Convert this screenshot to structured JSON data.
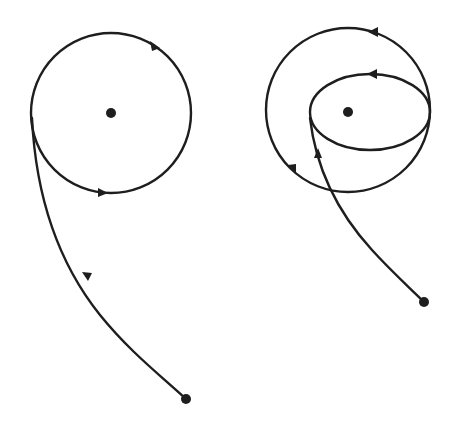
{
  "diagram": {
    "colors": {
      "line": "#1e1e1e",
      "background": "#ffffff"
    },
    "left_figure": {
      "central_body": {
        "cx": 111,
        "cy": 113,
        "r": 5
      },
      "circular_orbit": {
        "cx": 111,
        "cy": 113,
        "r": 80,
        "direction": "counterclockwise-arrows"
      },
      "approach_trajectory": {
        "start": [
          186,
          399
        ],
        "end": [
          32,
          120
        ],
        "direction": "toward-start-dot"
      },
      "start_point": {
        "cx": 186,
        "cy": 399,
        "r": 5
      }
    },
    "right_figure": {
      "central_body": {
        "cx": 348,
        "cy": 111,
        "r": 5
      },
      "outer_circle": {
        "cx": 348,
        "cy": 110,
        "r": 82
      },
      "inner_ellipse": {
        "cx": 370,
        "cy": 112,
        "rx": 60,
        "ry": 38
      },
      "trajectory": {
        "start": [
          424,
          302
        ],
        "end": [
          310,
          118
        ],
        "direction": "toward-orbit"
      },
      "start_point": {
        "cx": 424,
        "cy": 302,
        "r": 5
      }
    }
  }
}
